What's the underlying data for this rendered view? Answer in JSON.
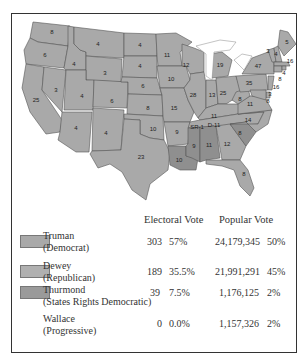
{
  "map": {
    "title": "1948 Presidential Election",
    "states": [
      {
        "abbr": "WA",
        "ev": "8",
        "winner": "Truman"
      },
      {
        "abbr": "OR",
        "ev": "6",
        "winner": "Dewey"
      },
      {
        "abbr": "CA",
        "ev": "25",
        "winner": "Truman"
      },
      {
        "abbr": "ID",
        "ev": "4",
        "winner": "Truman"
      },
      {
        "abbr": "NV",
        "ev": "3",
        "winner": "Truman"
      },
      {
        "abbr": "MT",
        "ev": "4",
        "winner": "Truman"
      },
      {
        "abbr": "WY",
        "ev": "3",
        "winner": "Truman"
      },
      {
        "abbr": "UT",
        "ev": "4",
        "winner": "Truman"
      },
      {
        "abbr": "CO",
        "ev": "6",
        "winner": "Truman"
      },
      {
        "abbr": "AZ",
        "ev": "4",
        "winner": "Truman"
      },
      {
        "abbr": "NM",
        "ev": "4",
        "winner": "Truman"
      },
      {
        "abbr": "ND",
        "ev": "4",
        "winner": "Dewey"
      },
      {
        "abbr": "SD",
        "ev": "4",
        "winner": "Dewey"
      },
      {
        "abbr": "NE",
        "ev": "6",
        "winner": "Dewey"
      },
      {
        "abbr": "KS",
        "ev": "8",
        "winner": "Dewey"
      },
      {
        "abbr": "OK",
        "ev": "10",
        "winner": "Truman"
      },
      {
        "abbr": "TX",
        "ev": "23",
        "winner": "Truman"
      },
      {
        "abbr": "MN",
        "ev": "11",
        "winner": "Truman"
      },
      {
        "abbr": "IA",
        "ev": "10",
        "winner": "Truman"
      },
      {
        "abbr": "MO",
        "ev": "15",
        "winner": "Truman"
      },
      {
        "abbr": "AR",
        "ev": "9",
        "winner": "Truman"
      },
      {
        "abbr": "LA",
        "ev": "10",
        "winner": "Thurmond"
      },
      {
        "abbr": "WI",
        "ev": "12",
        "winner": "Truman"
      },
      {
        "abbr": "IL",
        "ev": "28",
        "winner": "Truman"
      },
      {
        "abbr": "MI",
        "ev": "19",
        "winner": "Dewey"
      },
      {
        "abbr": "IN",
        "ev": "13",
        "winner": "Dewey"
      },
      {
        "abbr": "OH",
        "ev": "25",
        "winner": "Truman"
      },
      {
        "abbr": "KY",
        "ev": "11",
        "winner": "Truman"
      },
      {
        "abbr": "TN",
        "ev": "SR-1 D-11",
        "winner": "Truman"
      },
      {
        "abbr": "MS",
        "ev": "9",
        "winner": "Thurmond"
      },
      {
        "abbr": "AL",
        "ev": "11",
        "winner": "Thurmond"
      },
      {
        "abbr": "GA",
        "ev": "12",
        "winner": "Truman"
      },
      {
        "abbr": "FL",
        "ev": "8",
        "winner": "Truman"
      },
      {
        "abbr": "SC",
        "ev": "8",
        "winner": "Thurmond"
      },
      {
        "abbr": "NC",
        "ev": "14",
        "winner": "Truman"
      },
      {
        "abbr": "VA",
        "ev": "11",
        "winner": "Truman"
      },
      {
        "abbr": "WV",
        "ev": "8",
        "winner": "Truman"
      },
      {
        "abbr": "PA",
        "ev": "35",
        "winner": "Dewey"
      },
      {
        "abbr": "NY",
        "ev": "47",
        "winner": "Dewey"
      },
      {
        "abbr": "VT",
        "ev": "3",
        "winner": "Dewey"
      },
      {
        "abbr": "NH",
        "ev": "4",
        "winner": "Dewey"
      },
      {
        "abbr": "ME",
        "ev": "5",
        "winner": "Dewey"
      },
      {
        "abbr": "MA",
        "ev": "16",
        "winner": "Truman"
      },
      {
        "abbr": "RI",
        "ev": "4",
        "winner": "Truman"
      },
      {
        "abbr": "CT",
        "ev": "8",
        "winner": "Dewey"
      },
      {
        "abbr": "NJ",
        "ev": "16",
        "winner": "Dewey"
      },
      {
        "abbr": "DE",
        "ev": "3",
        "winner": "Dewey"
      },
      {
        "abbr": "MD",
        "ev": "8",
        "winner": "Dewey"
      }
    ]
  },
  "table": {
    "headers": {
      "electoral": "Electoral Vote",
      "popular": "Popular Vote"
    },
    "rows": [
      {
        "name": "Truman",
        "party": "(Democrat)",
        "ev": "303",
        "ev_pct": "57%",
        "pv": "24,179,345",
        "pv_pct": "50%",
        "swatch": "#a9a9a9"
      },
      {
        "name": "Dewey",
        "party": "(Republican)",
        "ev": "189",
        "ev_pct": "35.5%",
        "pv": "21,991,291",
        "pv_pct": "45%",
        "swatch": "#b0b0b0"
      },
      {
        "name": "Thurmond",
        "party": "(States Rights Democratic)",
        "ev": "39",
        "ev_pct": "7.5%",
        "pv": "1,176,125",
        "pv_pct": "2%",
        "swatch": "#9a9a9a"
      },
      {
        "name": "Wallace",
        "party": "(Progressive)",
        "ev": "0",
        "ev_pct": "0.0%",
        "pv": "1,157,326",
        "pv_pct": "2%",
        "swatch": null
      }
    ]
  }
}
